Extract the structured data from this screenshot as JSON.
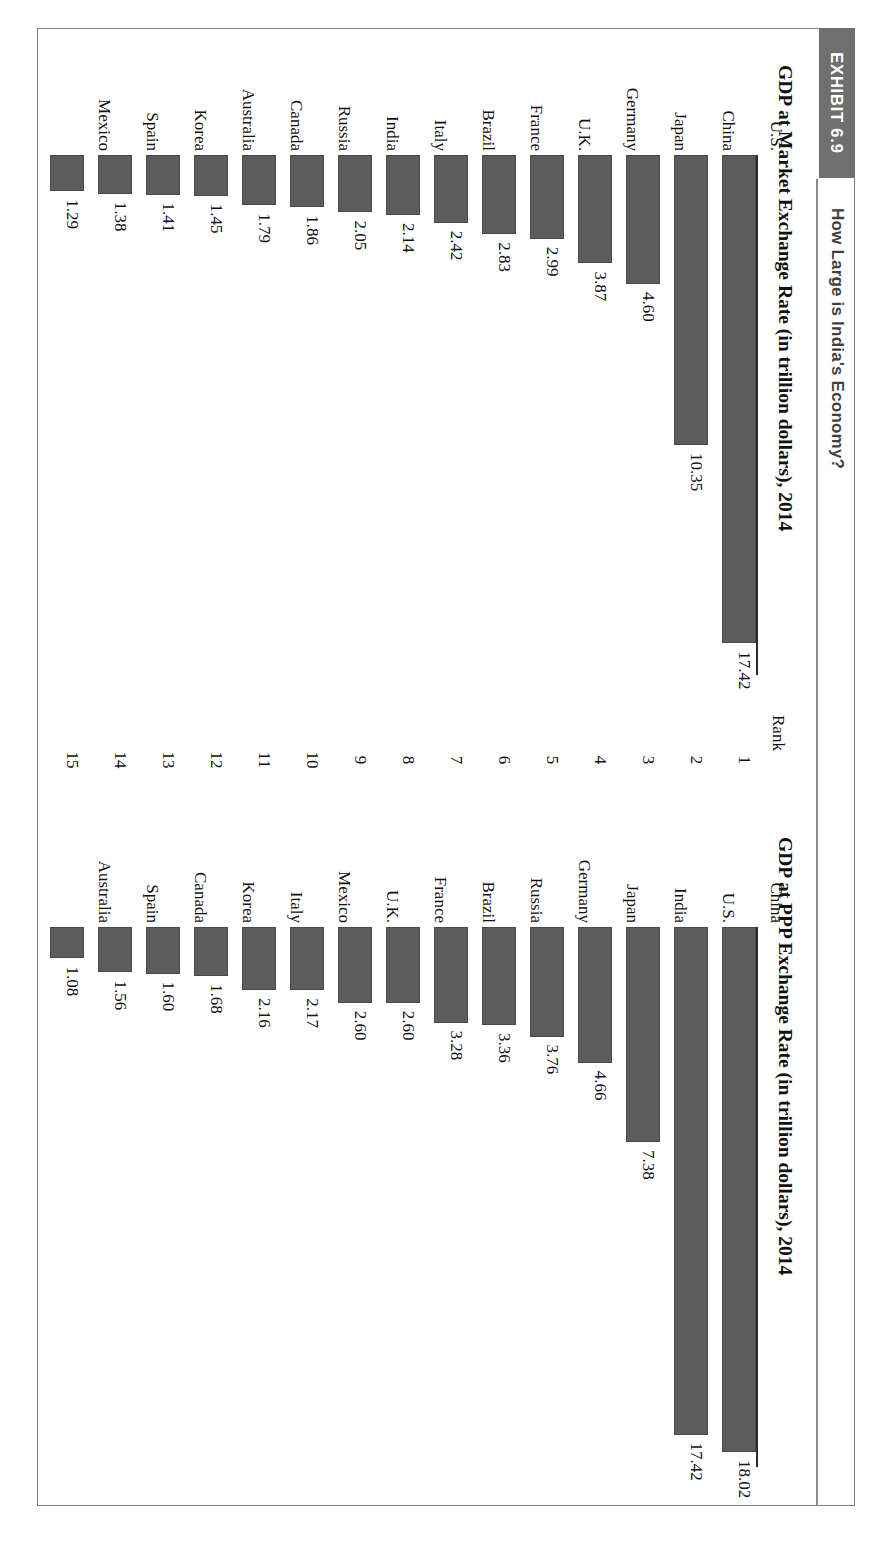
{
  "exhibit": {
    "tag": "EXHIBIT 6.9",
    "title": "How Large is India's Economy?"
  },
  "rank_column": {
    "header": "Rank",
    "values": [
      "1",
      "2",
      "3",
      "4",
      "5",
      "6",
      "7",
      "8",
      "9",
      "10",
      "11",
      "12",
      "13",
      "14",
      "15"
    ]
  },
  "chart_data": [
    {
      "type": "bar",
      "id": "market-exchange-rate",
      "title": "GDP at Market Exchange Rate (in trillion dollars), 2014",
      "xlabel": "",
      "ylabel": "",
      "orientation": "vertical",
      "ylim": [
        0,
        18.02
      ],
      "grid": false,
      "legend": "none",
      "categories": [
        "U.S.",
        "China",
        "Japan",
        "Germany",
        "U.K.",
        "France",
        "Brazil",
        "Italy",
        "India",
        "Russia",
        "Canada",
        "Australia",
        "Korea",
        "Spain",
        "Mexico"
      ],
      "values": [
        17.42,
        10.35,
        4.6,
        3.87,
        2.99,
        2.83,
        2.42,
        2.14,
        2.05,
        1.86,
        1.79,
        1.45,
        1.41,
        1.38,
        1.29
      ],
      "value_labels": [
        "17.42",
        "10.35",
        "4.60",
        "3.87",
        "2.99",
        "2.83",
        "2.42",
        "2.14",
        "2.05",
        "1.86",
        "1.79",
        "1.45",
        "1.41",
        "1.38",
        "1.29"
      ]
    },
    {
      "type": "bar",
      "id": "ppp-exchange-rate",
      "title": "GDP at PPP Exchange Rate (in trillion dollars), 2014",
      "xlabel": "",
      "ylabel": "",
      "orientation": "vertical",
      "ylim": [
        0,
        18.02
      ],
      "grid": false,
      "legend": "none",
      "categories": [
        "China",
        "U.S.",
        "India",
        "Japan",
        "Germany",
        "Russia",
        "Brazil",
        "France",
        "U.K.",
        "Mexico",
        "Italy",
        "Korea",
        "Canada",
        "Spain",
        "Australia"
      ],
      "values": [
        18.02,
        17.42,
        7.38,
        4.66,
        3.76,
        3.36,
        3.28,
        2.6,
        2.6,
        2.17,
        2.16,
        1.68,
        1.6,
        1.56,
        1.08
      ],
      "value_labels": [
        "18.02",
        "17.42",
        "7.38",
        "4.66",
        "3.76",
        "3.36",
        "3.28",
        "2.60",
        "2.60",
        "2.17",
        "2.16",
        "1.68",
        "1.60",
        "1.56",
        "1.08"
      ]
    }
  ],
  "colors": {
    "bar": "#5c5c5c",
    "tag_background": "#6f6f6f",
    "frame": "#7e7e7e",
    "axis": "#2b2b2b"
  }
}
